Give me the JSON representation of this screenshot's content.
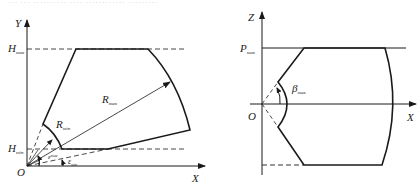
{
  "caption": {
    "text": "··· ··· ·········· ···· ············ ·········"
  },
  "left_figure": {
    "axis_y": "Y",
    "axis_x": "X",
    "origin": "O",
    "h_max": {
      "main": "H",
      "sub": "max"
    },
    "h_min": {
      "main": "H",
      "sub": "min"
    },
    "r_max": {
      "main": "R",
      "sub": "max"
    },
    "r_min": {
      "main": "R",
      "sub": "min"
    },
    "eps_max": {
      "main": "ε",
      "sub": "max"
    },
    "eps_min": {
      "main": "ε",
      "sub": "min"
    }
  },
  "right_figure": {
    "axis_z": "Z",
    "axis_x": "X",
    "origin": "O",
    "p_max": {
      "main": "P",
      "sub": "max"
    },
    "beta_max": {
      "main": "β",
      "sub": "max"
    }
  },
  "colors": {
    "line": "#1a1a1a",
    "background": "#ffffff"
  }
}
